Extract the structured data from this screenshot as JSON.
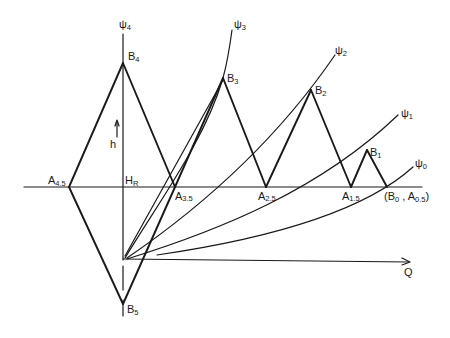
{
  "diagram": {
    "labels": {
      "psi4": "ψ",
      "psi4_sub": "4",
      "psi3": "ψ",
      "psi3_sub": "3",
      "psi2": "ψ",
      "psi2_sub": "2",
      "psi1": "ψ",
      "psi1_sub": "1",
      "psi0": "ψ",
      "psi0_sub": "0",
      "B4": "B",
      "B4_sub": "4",
      "B3": "B",
      "B3_sub": "3",
      "B2": "B",
      "B2_sub": "2",
      "B1": "B",
      "B1_sub": "1",
      "B5": "B",
      "B5_sub": "5",
      "A45": "A",
      "A45_sub": "4.5",
      "A35": "A",
      "A35_sub": "3.5",
      "A25": "A",
      "A25_sub": "2.5",
      "A15": "A",
      "A15_sub": "1.5",
      "B0A05_open": "(B",
      "B0A05_sub1": "0",
      "B0A05_mid": " , A",
      "B0A05_sub2": "0.5",
      "B0A05_close": ")",
      "HR": "H",
      "HR_sub": "R",
      "h": "h",
      "Q": "Q"
    },
    "colors": {
      "line": "#1a1a1a",
      "background": "#ffffff"
    }
  }
}
